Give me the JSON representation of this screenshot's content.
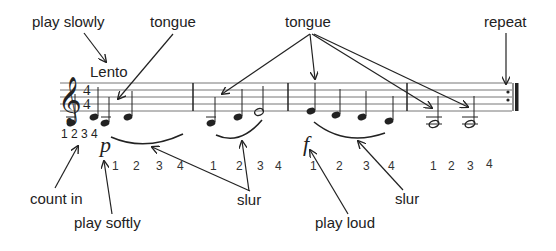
{
  "annotations": {
    "play_slowly": "play slowly",
    "tongue_1": "tongue",
    "tongue_2": "tongue",
    "repeat": "repeat",
    "count_in": "count in",
    "play_softly": "play softly",
    "slur_1": "slur",
    "play_loud": "play loud",
    "slur_2": "slur"
  },
  "score": {
    "tempo": "Lento",
    "clef": "treble-clef",
    "time_signature": {
      "top": "4",
      "bottom": "4"
    },
    "count_in": "1 2 3 4",
    "dynamics": {
      "soft": "p",
      "loud": "f"
    },
    "measures": [
      {
        "counts": [
          "1",
          "2",
          "3",
          "4"
        ],
        "notes": [
          "A quarter",
          "B quarter",
          "A quarter",
          "B quarter"
        ],
        "slur": true
      },
      {
        "counts": [
          "1",
          "2",
          "3",
          "4"
        ],
        "notes": [
          "A quarter",
          "C quarter",
          "D half"
        ],
        "slur": true
      },
      {
        "counts": [
          "1",
          "2",
          "3",
          "4"
        ],
        "notes": [
          "C quarter",
          "B quarter",
          "B quarter",
          "A quarter"
        ],
        "slur": true
      },
      {
        "counts": [
          "1",
          "2",
          "3",
          "4"
        ],
        "notes": [
          "A half",
          "A half"
        ],
        "slur": false
      }
    ],
    "ending": "repeat-sign"
  },
  "colors": {
    "ink": "#222222",
    "staff": "#777777",
    "background": "#ffffff"
  }
}
